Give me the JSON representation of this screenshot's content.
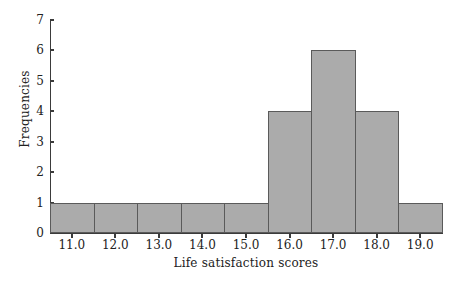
{
  "chart_data": {
    "type": "bar",
    "title": "",
    "xlabel": "Life satisfaction scores",
    "ylabel": "Frequencies",
    "categories": [
      "11.0",
      "12.0",
      "13.0",
      "14.0",
      "15.0",
      "16.0",
      "17.0",
      "18.0",
      "19.0"
    ],
    "values": [
      1,
      1,
      1,
      1,
      1,
      4,
      6,
      4,
      1
    ],
    "bin_edges": [
      10.5,
      11.5,
      12.5,
      13.5,
      14.5,
      15.5,
      16.5,
      17.5,
      18.5,
      19.5
    ],
    "xlim": [
      10.5,
      19.5
    ],
    "ylim": [
      0,
      7
    ],
    "ytick_labels": [
      "0",
      "1",
      "2",
      "3",
      "4",
      "5",
      "6",
      "7"
    ],
    "ytick_values": [
      0,
      1,
      2,
      3,
      4,
      5,
      6,
      7
    ],
    "xtick_labels": [
      "11.0",
      "12.0",
      "13.0",
      "14.0",
      "15.0",
      "16.0",
      "17.0",
      "18.0",
      "19.0"
    ],
    "grid": false,
    "legend": null,
    "bar_fill_color": "#ababab",
    "bar_edge_color": "#5a5a5a",
    "axis_color": "#3b3b3b",
    "background_color": "#ffffff"
  }
}
